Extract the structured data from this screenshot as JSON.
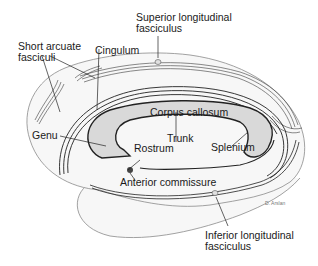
{
  "figure": {
    "type": "brain white matter tract diagram (medial/lateral schematic)",
    "credit": "D. Arslan",
    "colors": {
      "background": "#ffffff",
      "outline": "#8a8a8a",
      "tracts": "#3a3a3a",
      "corpus_callosum_fill": "#d9d9d9",
      "brain_fill": "#f7f7f7"
    }
  },
  "labels": {
    "superior_longitudinal_fasciculus": [
      "Superior longitudinal",
      "fasciculus"
    ],
    "short_arcuate_fasciculi": [
      "Short arcuate",
      "fasciculi"
    ],
    "cingulum": "Cingulum",
    "corpus_callosum": "Corpus callosum",
    "genu": "Genu",
    "trunk": "Trunk",
    "rostrum": "Rostrum",
    "splenium": "Splenium",
    "anterior_commissure": "Anterior commissure",
    "inferior_longitudinal_fasciculus": [
      "Inferior longitudinal",
      "fasciculus"
    ]
  }
}
